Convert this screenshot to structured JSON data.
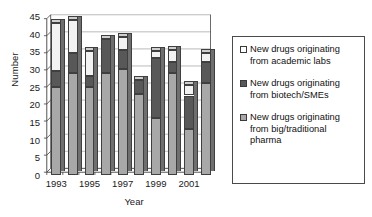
{
  "chart_data": {
    "type": "bar",
    "subtype": "stacked-bar-3d",
    "title": "",
    "xlabel": "Year",
    "ylabel": "Number",
    "ylim": [
      0,
      45
    ],
    "ytick_step": 5,
    "yticks": [
      "0",
      "5",
      "10",
      "15",
      "20",
      "25",
      "30",
      "35",
      "40",
      "45"
    ],
    "grid": true,
    "grid_axis": "y",
    "legend_position": "right-outside",
    "categories": [
      "1993",
      "1994",
      "1995",
      "1996",
      "1997",
      "1998",
      "1999",
      "2000",
      "2001",
      "2002"
    ],
    "xtick_labels_shown": [
      "1993",
      "1995",
      "1997",
      "1999",
      "2001"
    ],
    "series": [
      {
        "name": "New drugs originating from big/traditional pharma",
        "color": "#a8a8a8",
        "values": [
          25,
          29,
          25,
          29,
          30,
          23,
          16,
          29,
          13,
          26
        ]
      },
      {
        "name": "New drugs originating from biotech/SMEs",
        "color": "#585858",
        "values": [
          4.5,
          5.5,
          3,
          9.5,
          5.5,
          4,
          17,
          3,
          9.5,
          6
        ]
      },
      {
        "name": "New drugs originating from academic labs",
        "color": "#f2f2f2",
        "values": [
          13.5,
          9.5,
          7,
          0,
          3.5,
          0,
          2,
          3.5,
          3,
          2.5
        ]
      }
    ],
    "totals": [
      43,
      44,
      35,
      38.5,
      39,
      27,
      35,
      35.5,
      25.5,
      34.5
    ]
  },
  "legend": {
    "items": [
      {
        "swatch_color": "#ffffff",
        "label_line1": "New drugs originating",
        "label_line2": "from academic labs",
        "label_line3": ""
      },
      {
        "swatch_color": "#585858",
        "label_line1": "New drugs originating",
        "label_line2": "from biotech/SMEs",
        "label_line3": ""
      },
      {
        "swatch_color": "#a8a8a8",
        "label_line1": "New drugs originating",
        "label_line2": "from big/traditional",
        "label_line3": "pharma"
      }
    ]
  },
  "axes": {
    "ylabel": "Number",
    "xlabel": "Year"
  },
  "colors": {
    "academic": "#f2f2f2",
    "biotech": "#585858",
    "pharma": "#a8a8a8",
    "axis": "#3a3a3a",
    "grid": "#9a9a9a",
    "text": "#1a1a1a"
  }
}
